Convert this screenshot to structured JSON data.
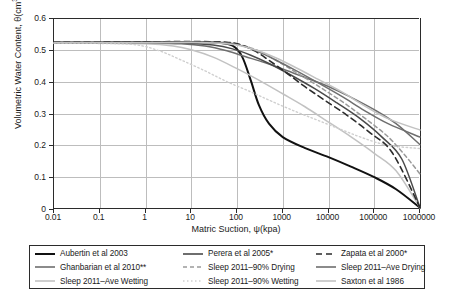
{
  "chart_data": {
    "type": "line",
    "title": "",
    "xlabel": "Matric Suction, ψ(kpa)",
    "ylabel": "Volumetric Water Content, θ(cm3/cm3)",
    "xscale": "log",
    "yscale": "linear",
    "xlim": [
      0.01,
      1000000
    ],
    "ylim": [
      0,
      0.6
    ],
    "grid": true,
    "legend_position": "below-plot",
    "x_ticks": [
      "0.01",
      "0.1",
      "1",
      "10",
      "100",
      "1000",
      "10000",
      "100000",
      "1000000"
    ],
    "x_tick_values": [
      0.01,
      0.1,
      1,
      10,
      100,
      1000,
      10000,
      100000,
      1000000
    ],
    "y_ticks": [
      "0",
      "0.1",
      "0.2",
      "0.3",
      "0.4",
      "0.5",
      "0.6"
    ],
    "y_tick_values": [
      0,
      0.1,
      0.2,
      0.3,
      0.4,
      0.5,
      0.6
    ],
    "x": [
      0.01,
      0.1,
      1,
      10,
      100,
      1000,
      10000,
      100000,
      1000000
    ],
    "series": [
      {
        "name": "Aubertin et al 2003",
        "color": "#111111",
        "width": 2.0,
        "dash": "none",
        "points": [
          [
            0.01,
            0.523
          ],
          [
            0.1,
            0.523
          ],
          [
            1,
            0.524
          ],
          [
            10,
            0.524
          ],
          [
            40,
            0.522
          ],
          [
            80,
            0.513
          ],
          [
            130,
            0.478
          ],
          [
            200,
            0.404
          ],
          [
            300,
            0.327
          ],
          [
            500,
            0.268
          ],
          [
            1000,
            0.226
          ],
          [
            3000,
            0.192
          ],
          [
            10000,
            0.163
          ],
          [
            30000,
            0.134
          ],
          [
            100000,
            0.1
          ],
          [
            300000,
            0.062
          ],
          [
            1000000,
            0.004
          ]
        ]
      },
      {
        "name": "Ghanbarian et al 2010**",
        "color": "#6e6e6e",
        "width": 1.5,
        "dash": "none",
        "points": [
          [
            0.01,
            0.521
          ],
          [
            0.1,
            0.521
          ],
          [
            1,
            0.521
          ],
          [
            6,
            0.519
          ],
          [
            20,
            0.512
          ],
          [
            60,
            0.497
          ],
          [
            150,
            0.479
          ],
          [
            400,
            0.46
          ],
          [
            1000,
            0.44
          ],
          [
            3000,
            0.414
          ],
          [
            10000,
            0.385
          ],
          [
            30000,
            0.352
          ],
          [
            100000,
            0.312
          ],
          [
            300000,
            0.268
          ],
          [
            1000000,
            0.202
          ]
        ]
      },
      {
        "name": "Sleep 2011-Ave Wetting",
        "color": "#c2c2c2",
        "width": 1.5,
        "dash": "none",
        "points": [
          [
            0.01,
            0.521
          ],
          [
            0.1,
            0.521
          ],
          [
            1,
            0.519
          ],
          [
            4,
            0.512
          ],
          [
            10,
            0.5
          ],
          [
            30,
            0.477
          ],
          [
            100,
            0.441
          ],
          [
            300,
            0.405
          ],
          [
            1000,
            0.362
          ],
          [
            3000,
            0.322
          ],
          [
            10000,
            0.273
          ],
          [
            30000,
            0.228
          ],
          [
            100000,
            0.175
          ],
          [
            300000,
            0.12
          ],
          [
            1000000,
            0.004
          ]
        ]
      },
      {
        "name": "Perera et al 2005*",
        "color": "#4a4a4a",
        "width": 1.5,
        "dash": "none",
        "points": [
          [
            0.01,
            0.522
          ],
          [
            0.1,
            0.522
          ],
          [
            1,
            0.522
          ],
          [
            8,
            0.521
          ],
          [
            30,
            0.515
          ],
          [
            80,
            0.503
          ],
          [
            200,
            0.483
          ],
          [
            500,
            0.457
          ],
          [
            1500,
            0.421
          ],
          [
            5000,
            0.378
          ],
          [
            15000,
            0.334
          ],
          [
            50000,
            0.283
          ],
          [
            150000,
            0.225
          ],
          [
            400000,
            0.157
          ],
          [
            1000000,
            0.004
          ]
        ]
      },
      {
        "name": "Sleep 2011-90% Drying",
        "color": "#9a9a9a",
        "width": 1.5,
        "dash": "4,3",
        "points": [
          [
            0.01,
            0.523
          ],
          [
            0.1,
            0.523
          ],
          [
            1,
            0.524
          ],
          [
            10,
            0.524
          ],
          [
            60,
            0.521
          ],
          [
            150,
            0.512
          ],
          [
            350,
            0.492
          ],
          [
            800,
            0.463
          ],
          [
            2000,
            0.428
          ],
          [
            6000,
            0.386
          ],
          [
            20000,
            0.337
          ],
          [
            60000,
            0.287
          ],
          [
            200000,
            0.227
          ],
          [
            500000,
            0.164
          ],
          [
            1000000,
            0.11
          ]
        ]
      },
      {
        "name": "Sleep 2011-90% Wetting",
        "color": "#cfcfcf",
        "width": 1.4,
        "dash": "1.5,2.5",
        "points": [
          [
            0.01,
            0.521
          ],
          [
            0.1,
            0.52
          ],
          [
            0.6,
            0.516
          ],
          [
            2,
            0.497
          ],
          [
            6,
            0.468
          ],
          [
            20,
            0.434
          ],
          [
            60,
            0.4
          ],
          [
            200,
            0.368
          ],
          [
            600,
            0.337
          ],
          [
            2000,
            0.305
          ],
          [
            6000,
            0.278
          ],
          [
            20000,
            0.248
          ],
          [
            60000,
            0.222
          ],
          [
            200000,
            0.2
          ],
          [
            1000000,
            0.19
          ]
        ]
      },
      {
        "name": "Zapata et al 2000*",
        "color": "#2b2b2b",
        "width": 1.6,
        "dash": "6,4",
        "points": [
          [
            0.01,
            0.524
          ],
          [
            0.1,
            0.524
          ],
          [
            1,
            0.525
          ],
          [
            10,
            0.526
          ],
          [
            60,
            0.524
          ],
          [
            120,
            0.516
          ],
          [
            250,
            0.496
          ],
          [
            500,
            0.467
          ],
          [
            1200,
            0.428
          ],
          [
            3000,
            0.385
          ],
          [
            8000,
            0.343
          ],
          [
            25000,
            0.295
          ],
          [
            80000,
            0.24
          ],
          [
            250000,
            0.176
          ],
          [
            1000000,
            0.004
          ]
        ]
      },
      {
        "name": "Sleep 2011-Ave Drying",
        "color": "#6e6e6e",
        "width": 1.5,
        "dash": "none",
        "points": [
          [
            0.01,
            0.523
          ],
          [
            0.1,
            0.523
          ],
          [
            1,
            0.524
          ],
          [
            10,
            0.525
          ],
          [
            50,
            0.523
          ],
          [
            120,
            0.514
          ],
          [
            280,
            0.495
          ],
          [
            700,
            0.468
          ],
          [
            2000,
            0.434
          ],
          [
            6000,
            0.396
          ],
          [
            20000,
            0.353
          ],
          [
            60000,
            0.31
          ],
          [
            200000,
            0.268
          ],
          [
            1000000,
            0.226
          ]
        ]
      },
      {
        "name": "Saxton et al 1986",
        "color": "#c2c2c2",
        "width": 1.5,
        "dash": "none",
        "points": [
          [
            0.01,
            0.522
          ],
          [
            0.1,
            0.522
          ],
          [
            1,
            0.522
          ],
          [
            10,
            0.523
          ],
          [
            40,
            0.521
          ],
          [
            100,
            0.515
          ],
          [
            250,
            0.5
          ],
          [
            700,
            0.475
          ],
          [
            2000,
            0.443
          ],
          [
            6000,
            0.407
          ],
          [
            20000,
            0.367
          ],
          [
            60000,
            0.325
          ],
          [
            200000,
            0.284
          ],
          [
            1000000,
            0.248
          ]
        ]
      }
    ]
  },
  "axes": {
    "y_title": "Volumetric Water Content, θ(cm",
    "y_title_sup1": "3",
    "y_title_mid": "/cm",
    "y_title_sup2": "3",
    "y_title_end": ")",
    "x_title": "Matric Suction, ψ(kpa)"
  },
  "legend": {
    "entries": [
      {
        "label": "Aubertin et al 2003",
        "color": "#111111",
        "width": 2.0,
        "dash": "none"
      },
      {
        "label": "Perera et al 2005*",
        "color": "#4a4a4a",
        "width": 1.6,
        "dash": "none"
      },
      {
        "label": "Zapata et al 2000*",
        "color": "#2b2b2b",
        "width": 1.6,
        "dash": "6,4"
      },
      {
        "label": "Ghanbarian et al 2010**",
        "color": "#6e6e6e",
        "width": 1.6,
        "dash": "none"
      },
      {
        "label": "Sleep 2011–90% Drying",
        "color": "#9a9a9a",
        "width": 1.5,
        "dash": "4,3"
      },
      {
        "label": "Sleep 2011–Ave Drying",
        "color": "#6e6e6e",
        "width": 1.6,
        "dash": "none"
      },
      {
        "label": "Sleep 2011–Ave Wetting",
        "color": "#c2c2c2",
        "width": 1.6,
        "dash": "none"
      },
      {
        "label": "Sleep 2011–90% Wetting",
        "color": "#cfcfcf",
        "width": 1.4,
        "dash": "1.5,2.5"
      },
      {
        "label": "Saxton et al 1986",
        "color": "#c2c2c2",
        "width": 1.6,
        "dash": "none"
      }
    ]
  }
}
